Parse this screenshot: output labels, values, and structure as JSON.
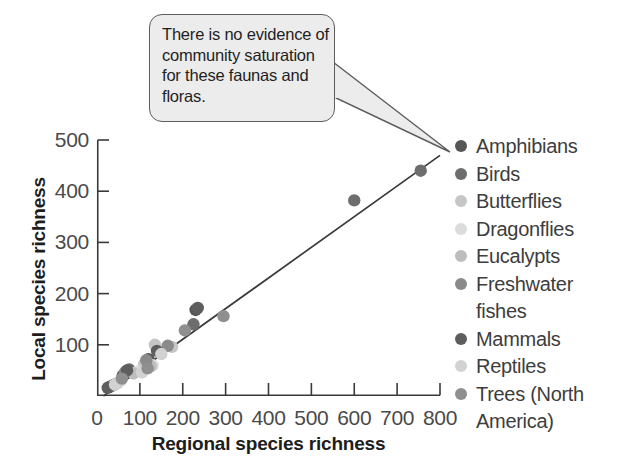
{
  "figure": {
    "background": "#ffffff",
    "ink": "#2b2b2b"
  },
  "callout": {
    "name": "annotation-callout",
    "text": "There is no evidence of community saturation for these faunas and floras.",
    "fill": "#ececec",
    "stroke": "#5d5d5d",
    "points_to": "top-right data point"
  },
  "legend": {
    "position": "right",
    "entries": [
      {
        "label": "Amphibians",
        "color": "#565656",
        "continuation": ""
      },
      {
        "label": "Birds",
        "color": "#6d6d6d",
        "continuation": ""
      },
      {
        "label": "Butterflies",
        "color": "#c6c6c6",
        "continuation": ""
      },
      {
        "label": "Dragonflies",
        "color": "#dcdcdc",
        "continuation": ""
      },
      {
        "label": "Eucalypts",
        "color": "#bdbdbd",
        "continuation": ""
      },
      {
        "label": "Freshwater",
        "color": "#8a8a8a",
        "continuation": "fishes"
      },
      {
        "label": "Mammals",
        "color": "#5e5e5e",
        "continuation": ""
      },
      {
        "label": "Reptiles",
        "color": "#d2d2d2",
        "continuation": ""
      },
      {
        "label": "Trees (North",
        "color": "#8f8f8f",
        "continuation": "America)"
      }
    ]
  },
  "chart_data": {
    "type": "scatter",
    "title": "",
    "xlabel": "Regional species richness",
    "ylabel": "Local species richness",
    "xlim": [
      0,
      800
    ],
    "ylim": [
      0,
      500
    ],
    "xticks": [
      0,
      100,
      200,
      300,
      400,
      500,
      600,
      700,
      800
    ],
    "yticks": [
      0,
      100,
      200,
      300,
      400,
      500
    ],
    "ytick_labels": [
      "",
      "100",
      "200",
      "300",
      "400",
      "500"
    ],
    "xtick_labels": [
      "0",
      "100",
      "200",
      "300",
      "400",
      "500",
      "600",
      "700",
      "800"
    ],
    "grid": false,
    "legend_position": "right",
    "trendline": {
      "name": "regression-line",
      "x": [
        15,
        800
      ],
      "y": [
        0,
        470
      ],
      "color": "#3a3a3a"
    },
    "series": [
      {
        "name": "Amphibians",
        "color": "#565656",
        "points": [
          [
            40,
            22
          ],
          [
            60,
            40
          ],
          [
            120,
            72
          ],
          [
            230,
            168
          ]
        ]
      },
      {
        "name": "Birds",
        "color": "#6d6d6d",
        "points": [
          [
            30,
            18
          ],
          [
            75,
            52
          ],
          [
            225,
            140
          ],
          [
            600,
            382
          ],
          [
            755,
            440
          ]
        ]
      },
      {
        "name": "Butterflies",
        "color": "#c6c6c6",
        "points": [
          [
            55,
            30
          ],
          [
            110,
            62
          ],
          [
            135,
            100
          ],
          [
            175,
            96
          ]
        ]
      },
      {
        "name": "Dragonflies",
        "color": "#dcdcdc",
        "points": [
          [
            50,
            26
          ],
          [
            95,
            48
          ],
          [
            130,
            60
          ]
        ]
      },
      {
        "name": "Eucalypts",
        "color": "#bdbdbd",
        "points": [
          [
            45,
            24
          ],
          [
            85,
            44
          ],
          [
            125,
            58
          ]
        ]
      },
      {
        "name": "Freshwater fishes",
        "color": "#8a8a8a",
        "points": [
          [
            35,
            20
          ],
          [
            65,
            46
          ],
          [
            115,
            70
          ],
          [
            165,
            98
          ]
        ]
      },
      {
        "name": "Mammals",
        "color": "#5e5e5e",
        "points": [
          [
            25,
            16
          ],
          [
            70,
            50
          ],
          [
            140,
            88
          ],
          [
            235,
            172
          ]
        ]
      },
      {
        "name": "Reptiles",
        "color": "#d2d2d2",
        "points": [
          [
            42,
            22
          ],
          [
            105,
            46
          ],
          [
            150,
            82
          ]
        ]
      },
      {
        "name": "Trees (North America)",
        "color": "#8f8f8f",
        "points": [
          [
            58,
            34
          ],
          [
            118,
            54
          ],
          [
            205,
            128
          ],
          [
            295,
            156
          ]
        ]
      }
    ]
  }
}
